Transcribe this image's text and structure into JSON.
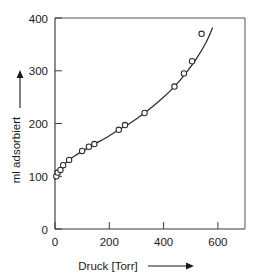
{
  "chart_data": {
    "type": "scatter",
    "title": "",
    "subtitle": "",
    "xlabel": "Druck [Torr]",
    "ylabel": "ml adsorbiert",
    "xlim": [
      0,
      700
    ],
    "ylim": [
      0,
      400
    ],
    "xticks": [
      0,
      200,
      400,
      600
    ],
    "yticks": [
      0,
      100,
      200,
      300,
      400
    ],
    "xticklabels": [
      "0",
      "200",
      "400",
      "600"
    ],
    "yticklabels": [
      "0",
      "100",
      "200",
      "300",
      "400"
    ],
    "grid": false,
    "legend": null,
    "legend_position": "none",
    "marker_style": "open-circle",
    "series": [
      {
        "name": "Adsorptionsisotherme",
        "x": [
          5,
          10,
          20,
          30,
          52,
          100,
          125,
          145,
          235,
          258,
          330,
          440,
          475,
          505,
          540
        ],
        "y": [
          100,
          107,
          112,
          121,
          131,
          148,
          156,
          161,
          188,
          197,
          220,
          270,
          295,
          318,
          370
        ]
      }
    ],
    "fit_curve": {
      "name": "smoothed isotherm",
      "x": [
        0,
        25,
        52,
        80,
        110,
        145,
        185,
        235,
        275,
        330,
        385,
        440,
        480,
        520,
        555,
        580
      ],
      "y": [
        94,
        117,
        131,
        141,
        150,
        161,
        172,
        188,
        200,
        220,
        243,
        270,
        294,
        322,
        352,
        381
      ]
    },
    "axis_arrows": {
      "x": "right",
      "y": "up"
    },
    "colors": {
      "line": "#2b2b2b",
      "marker_face": "#ffffff",
      "marker_edge": "#2b2b2b",
      "axis": "#3a3a3a",
      "text": "#1a1a1a",
      "background": "#ffffff"
    }
  }
}
